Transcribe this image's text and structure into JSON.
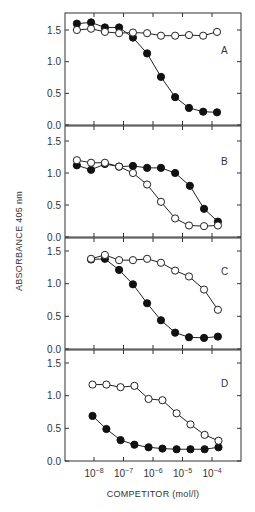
{
  "chart_data": {
    "type": "line",
    "layout": "4 vertically stacked panels sharing a log x-axis",
    "ylabel": "ABSORBANCE 405 nm",
    "xlabel": "COMPETITOR (mol/l)",
    "x_scale": "log10",
    "x_ticks": [
      {
        "exp": -8,
        "label_base": "10",
        "label_exp": "−8"
      },
      {
        "exp": -7,
        "label_base": "10",
        "label_exp": "−7"
      },
      {
        "exp": -6,
        "label_base": "10",
        "label_exp": "−6"
      },
      {
        "exp": -5,
        "label_base": "10",
        "label_exp": "−5"
      },
      {
        "exp": -4,
        "label_base": "10",
        "label_exp": "−4"
      }
    ],
    "y_ticks": [
      "0.0",
      "0.5",
      "1.0",
      "1.5"
    ],
    "ylim": [
      0,
      1.5
    ],
    "grid": false,
    "legend": null,
    "panels": [
      {
        "letter": "A",
        "series": [
          {
            "name": "filled circles",
            "marker": "filled",
            "log_x": [
              -8.58,
              -8.1,
              -7.63,
              -7.15,
              -6.68,
              -6.2,
              -5.73,
              -5.25,
              -4.78,
              -4.3,
              -3.83
            ],
            "values": [
              1.6,
              1.62,
              1.54,
              1.54,
              1.38,
              1.13,
              0.76,
              0.44,
              0.27,
              0.21,
              0.2
            ]
          },
          {
            "name": "open circles",
            "marker": "open",
            "log_x": [
              -8.58,
              -8.1,
              -7.63,
              -7.15,
              -6.68,
              -6.2,
              -5.73,
              -5.25,
              -4.78,
              -4.3,
              -3.83
            ],
            "values": [
              1.5,
              1.52,
              1.47,
              1.45,
              1.46,
              1.45,
              1.41,
              1.41,
              1.42,
              1.41,
              1.47
            ]
          }
        ]
      },
      {
        "letter": "B",
        "series": [
          {
            "name": "filled circles",
            "marker": "filled",
            "log_x": [
              -8.58,
              -8.1,
              -7.63,
              -7.15,
              -6.68,
              -6.2,
              -5.73,
              -5.25,
              -4.75,
              -4.27,
              -3.8
            ],
            "values": [
              1.12,
              1.05,
              1.14,
              1.1,
              1.11,
              1.08,
              1.08,
              1.0,
              0.8,
              0.44,
              0.24
            ]
          },
          {
            "name": "open circles",
            "marker": "open",
            "log_x": [
              -8.58,
              -8.1,
              -7.63,
              -7.15,
              -6.68,
              -6.2,
              -5.73,
              -5.25,
              -4.78,
              -4.27,
              -3.8
            ],
            "values": [
              1.2,
              1.16,
              1.16,
              1.1,
              1.0,
              0.82,
              0.55,
              0.29,
              0.18,
              0.17,
              0.18
            ]
          }
        ]
      },
      {
        "letter": "C",
        "series": [
          {
            "name": "filled circles",
            "marker": "filled",
            "log_x": [
              -8.1,
              -7.63,
              -7.15,
              -6.68,
              -6.2,
              -5.73,
              -5.25,
              -4.78,
              -4.27,
              -3.8
            ],
            "values": [
              1.37,
              1.38,
              1.21,
              0.99,
              0.7,
              0.44,
              0.25,
              0.18,
              0.17,
              0.19
            ]
          },
          {
            "name": "open circles",
            "marker": "open",
            "log_x": [
              -8.1,
              -7.63,
              -7.15,
              -6.68,
              -6.2,
              -5.73,
              -5.25,
              -4.78,
              -4.27,
              -3.8
            ],
            "values": [
              1.38,
              1.44,
              1.36,
              1.36,
              1.38,
              1.32,
              1.2,
              1.11,
              0.91,
              0.6
            ]
          }
        ]
      },
      {
        "letter": "D",
        "series": [
          {
            "name": "filled circles",
            "marker": "filled",
            "log_x": [
              -8.05,
              -7.58,
              -7.1,
              -6.63,
              -6.15,
              -5.68,
              -5.2,
              -4.73,
              -4.25,
              -3.78
            ],
            "values": [
              0.69,
              0.49,
              0.32,
              0.25,
              0.21,
              0.19,
              0.18,
              0.18,
              0.18,
              0.21
            ]
          },
          {
            "name": "open circles",
            "marker": "open",
            "log_x": [
              -8.05,
              -7.58,
              -7.1,
              -6.63,
              -6.15,
              -5.68,
              -5.2,
              -4.73,
              -4.25,
              -3.78
            ],
            "values": [
              1.17,
              1.17,
              1.13,
              1.15,
              0.95,
              0.93,
              0.73,
              0.56,
              0.4,
              0.31
            ]
          }
        ]
      }
    ]
  }
}
